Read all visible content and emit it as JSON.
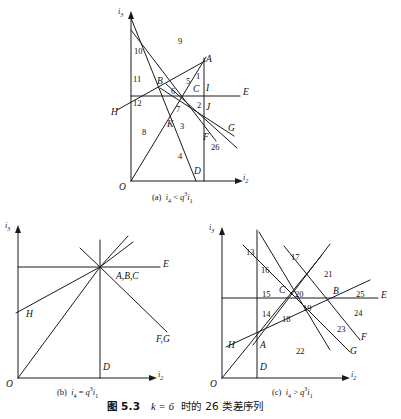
{
  "figure": {
    "main_caption_prefix": "图 5.3",
    "main_caption_k": "k = 6",
    "main_caption_rest": "时的 26 类差序列",
    "line_color": "#1a1a1a"
  },
  "panels": [
    {
      "id": "a",
      "caption_label": "(a)",
      "caption_expr_lhs": "i",
      "caption_expr_lhs_sub": "4",
      "caption_rel": "<",
      "caption_rhs_q": "q",
      "caption_rhs_sup": "3",
      "caption_rhs_i": "i",
      "caption_rhs_sub": "1",
      "axis_y": "i",
      "axis_y_sub": "3",
      "axis_x": "i",
      "axis_x_sub": "2",
      "origin": "O",
      "region_numbers": [
        "1",
        "2",
        "3",
        "4",
        "5",
        "6",
        "7",
        "8",
        "9",
        "10",
        "11",
        "12",
        "26"
      ],
      "points": [
        "A",
        "B",
        "C",
        "D",
        "F",
        "G",
        "H",
        "I",
        "J",
        "K",
        "E"
      ]
    },
    {
      "id": "b",
      "caption_label": "(b)",
      "caption_expr_lhs": "i",
      "caption_expr_lhs_sub": "4",
      "caption_rel": "=",
      "caption_rhs_q": "q",
      "caption_rhs_sup": "3",
      "caption_rhs_i": "i",
      "caption_rhs_sub": "1",
      "axis_y": "i",
      "axis_y_sub": "3",
      "axis_x": "i",
      "axis_x_sub": "2",
      "origin": "O",
      "point_cluster": "A,B,C",
      "point_FG": "F,G",
      "point_E": "E",
      "point_H": "H",
      "point_D": "D"
    },
    {
      "id": "c",
      "caption_label": "(c)",
      "caption_expr_lhs": "i",
      "caption_expr_lhs_sub": "4",
      "caption_rel": ">",
      "caption_rhs_q": "q",
      "caption_rhs_sup": "3",
      "caption_rhs_i": "i",
      "caption_rhs_sub": "1",
      "axis_y": "i",
      "axis_y_sub": "3",
      "axis_x": "i",
      "axis_x_sub": "2",
      "origin": "O",
      "region_numbers": [
        "13",
        "14",
        "15",
        "16",
        "17",
        "18",
        "19",
        "20",
        "21",
        "22",
        "23",
        "24",
        "25"
      ],
      "points": [
        "A",
        "B",
        "C",
        "D",
        "E",
        "F",
        "G",
        "H"
      ]
    }
  ],
  "panel_a_labels": {
    "n1": "1",
    "n2": "2",
    "n3": "3",
    "n4": "4",
    "n5": "5",
    "n6": "6",
    "n7": "7",
    "n8": "8",
    "n9": "9",
    "n10": "10",
    "n11": "11",
    "n12": "12",
    "n26": "26",
    "pA": "A",
    "pB": "B",
    "pC": "C",
    "pD": "D",
    "pE": "E",
    "pF": "F",
    "pG": "G",
    "pH": "H",
    "pI": "I",
    "pJ": "J",
    "pK": "K",
    "pO": "O"
  },
  "panel_b_labels": {
    "pABC": "A,B,C",
    "pD": "D",
    "pE": "E",
    "pFG": "F,G",
    "pH": "H",
    "pO": "O"
  },
  "panel_c_labels": {
    "n13": "13",
    "n14": "14",
    "n15": "15",
    "n16": "16",
    "n17": "17",
    "n18": "18",
    "n19": "19",
    "n20": "20",
    "n21": "21",
    "n22": "22",
    "n23": "23",
    "n24": "24",
    "n25": "25",
    "pA": "A",
    "pB": "B",
    "pC": "C",
    "pD": "D",
    "pE": "E",
    "pF": "F",
    "pG": "G",
    "pH": "H",
    "pO": "O"
  }
}
